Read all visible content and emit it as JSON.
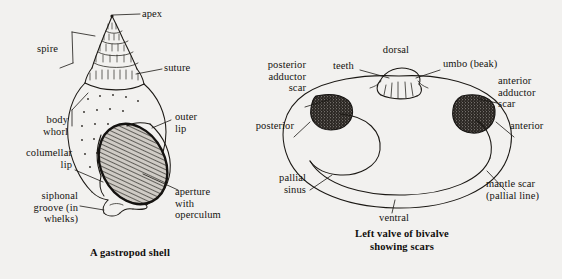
{
  "page": {
    "background_color": "#f2f1ef",
    "ink_color": "#1b1814",
    "width": 562,
    "height": 279
  },
  "figures": [
    {
      "id": "gastropod",
      "caption": "A gastropod shell",
      "labels": [
        {
          "key": "apex",
          "text": "apex"
        },
        {
          "key": "spire",
          "text": "spire"
        },
        {
          "key": "suture",
          "text": "suture"
        },
        {
          "key": "body_whorl",
          "text": "body\nwhorl"
        },
        {
          "key": "columellar_lip",
          "text": "columellar\nlip"
        },
        {
          "key": "siphonal_groove",
          "text": "siphonal\ngroove (in\nwhelks)"
        },
        {
          "key": "outer_lip",
          "text": "outer\nlip"
        },
        {
          "key": "aperture",
          "text": "aperture\nwith\noperculum"
        }
      ]
    },
    {
      "id": "bivalve",
      "caption": "Left valve of bivalve\nshowing scars",
      "labels": [
        {
          "key": "dorsal",
          "text": "dorsal"
        },
        {
          "key": "teeth",
          "text": "teeth"
        },
        {
          "key": "umbo",
          "text": "umbo (beak)"
        },
        {
          "key": "posterior_adductor_scar",
          "text": "posterior\nadductor\nscar"
        },
        {
          "key": "anterior_adductor_scar",
          "text": "anterior\nadductor\nscar"
        },
        {
          "key": "posterior",
          "text": "posterior"
        },
        {
          "key": "anterior",
          "text": "anterior"
        },
        {
          "key": "pallial_sinus",
          "text": "pallial\nsinus"
        },
        {
          "key": "ventral",
          "text": "ventral"
        },
        {
          "key": "mantle_scar",
          "text": "mantle scar\n(pallial line)"
        }
      ]
    }
  ]
}
